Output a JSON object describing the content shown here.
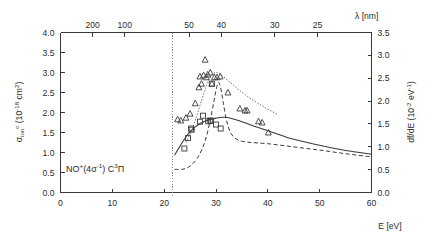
{
  "figure": {
    "background": "#ffffff",
    "ink": "#3a3a3a"
  },
  "annotation": {
    "species_prefix": "NO",
    "species_charge": "+",
    "orbital_open": "(4",
    "orbital_sigma": "σ",
    "orbital_exp": "-1",
    "orbital_close": ")",
    "state_letter": " C",
    "state_mult": "3",
    "state_term": "Π",
    "full_text": "NO+(4σ-1) C3Π"
  },
  "axes": {
    "bottom": {
      "label_main": "E",
      "label_unit": "[eV]",
      "label_full": "E [eV]",
      "min": 0,
      "max": 60,
      "ticks": [
        0,
        10,
        20,
        30,
        40,
        50,
        60
      ],
      "tick_labels": [
        "0",
        "10",
        "20",
        "30",
        "40",
        "50",
        "60"
      ]
    },
    "left": {
      "symbol": "σ",
      "subscript": "ion",
      "superscript": "c",
      "unit": "(10-18 cm2)",
      "label_full": "σion c (10-18 cm2)",
      "min": 0.0,
      "max": 4.0,
      "ticks": [
        0.0,
        0.5,
        1.0,
        1.5,
        2.0,
        2.5,
        3.0,
        3.5,
        4.0
      ],
      "tick_labels": [
        "0.0",
        "0.5",
        "1.0",
        "1.5",
        "2.0",
        "2.5",
        "3.0",
        "3.5",
        "4.0"
      ]
    },
    "right": {
      "label_main": "df/dE",
      "unit": "(10-2 eV-1)",
      "label_full": "df/dE (10-2 eV-1)",
      "min": 0.0,
      "max": 3.5,
      "ticks": [
        0.0,
        0.5,
        1.0,
        1.5,
        2.0,
        2.5,
        3.0,
        3.5
      ],
      "tick_labels": [
        "0.0",
        "0.5",
        "1.0",
        "1.5",
        "2.0",
        "2.5",
        "3.0",
        "3.5"
      ]
    },
    "top": {
      "symbol": "λ",
      "unit": "[nm]",
      "label_full": "λ [nm]",
      "tick_values_nm": [
        200,
        100,
        50,
        40,
        30,
        25
      ],
      "tick_labels": [
        "200",
        "100",
        "50",
        "40",
        "30",
        "25"
      ],
      "relation": "lambda_nm = 1239.84 / E_eV"
    }
  },
  "chart_data": {
    "type": "scatter",
    "title": "",
    "xlabel": "E [eV]",
    "ylabel": "σion c (10-18 cm2)",
    "y2label": "df/dE (10-2 eV-1)",
    "xlim": [
      0,
      60
    ],
    "ylim": [
      0.0,
      4.0
    ],
    "y2lim": [
      0.0,
      3.5
    ],
    "grid": false,
    "legend": "none",
    "annotations": [
      {
        "text": "NO+(4σ-1) C3Π",
        "x": 8.5,
        "y": 0.62
      },
      {
        "type": "vline",
        "label": "ionization threshold",
        "x": 21.7,
        "style": "dotted"
      }
    ],
    "series": [
      {
        "name": "squares",
        "marker": "open-square",
        "axis": "left",
        "points": [
          {
            "x": 23.9,
            "y": 1.1
          },
          {
            "x": 24.6,
            "y": 1.36
          },
          {
            "x": 25.2,
            "y": 1.6
          },
          {
            "x": 25.3,
            "y": 1.57
          },
          {
            "x": 26.9,
            "y": 1.77
          },
          {
            "x": 27.5,
            "y": 1.92
          },
          {
            "x": 28.5,
            "y": 1.78
          },
          {
            "x": 28.9,
            "y": 1.8
          },
          {
            "x": 29.0,
            "y": 1.79
          },
          {
            "x": 29.2,
            "y": 2.72
          },
          {
            "x": 30.0,
            "y": 1.7
          },
          {
            "x": 30.9,
            "y": 1.6
          }
        ]
      },
      {
        "name": "triangles",
        "marker": "open-triangle",
        "axis": "left",
        "points": [
          {
            "x": 22.6,
            "y": 1.83
          },
          {
            "x": 23.2,
            "y": 1.8
          },
          {
            "x": 24.2,
            "y": 1.87
          },
          {
            "x": 25.0,
            "y": 1.97
          },
          {
            "x": 26.0,
            "y": 2.23
          },
          {
            "x": 26.7,
            "y": 2.63
          },
          {
            "x": 26.9,
            "y": 2.9
          },
          {
            "x": 27.2,
            "y": 2.72
          },
          {
            "x": 27.6,
            "y": 2.93
          },
          {
            "x": 27.9,
            "y": 3.32
          },
          {
            "x": 28.1,
            "y": 2.88
          },
          {
            "x": 28.4,
            "y": 2.95
          },
          {
            "x": 28.9,
            "y": 3.0
          },
          {
            "x": 29.2,
            "y": 2.72
          },
          {
            "x": 29.7,
            "y": 2.88
          },
          {
            "x": 30.2,
            "y": 2.88
          },
          {
            "x": 30.8,
            "y": 2.9
          },
          {
            "x": 32.3,
            "y": 2.5
          },
          {
            "x": 34.6,
            "y": 2.1
          },
          {
            "x": 35.6,
            "y": 2.05
          },
          {
            "x": 36.0,
            "y": 2.05
          },
          {
            "x": 38.2,
            "y": 1.78
          },
          {
            "x": 38.9,
            "y": 1.75
          },
          {
            "x": 40.1,
            "y": 1.5
          }
        ]
      },
      {
        "name": "solid-curve",
        "style": "solid",
        "axis": "left",
        "points": [
          {
            "x": 22.0,
            "y": 0.93
          },
          {
            "x": 23.0,
            "y": 1.15
          },
          {
            "x": 24.0,
            "y": 1.35
          },
          {
            "x": 25.0,
            "y": 1.52
          },
          {
            "x": 26.0,
            "y": 1.64
          },
          {
            "x": 27.0,
            "y": 1.73
          },
          {
            "x": 28.0,
            "y": 1.79
          },
          {
            "x": 29.0,
            "y": 1.83
          },
          {
            "x": 30.0,
            "y": 1.86
          },
          {
            "x": 31.5,
            "y": 1.88
          },
          {
            "x": 33.0,
            "y": 1.85
          },
          {
            "x": 35.0,
            "y": 1.77
          },
          {
            "x": 38.0,
            "y": 1.63
          },
          {
            "x": 41.0,
            "y": 1.5
          },
          {
            "x": 45.0,
            "y": 1.33
          },
          {
            "x": 50.0,
            "y": 1.18
          },
          {
            "x": 55.0,
            "y": 1.05
          },
          {
            "x": 60.0,
            "y": 0.96
          }
        ]
      },
      {
        "name": "dashed-curve",
        "style": "dashed",
        "axis": "left",
        "points": [
          {
            "x": 22.0,
            "y": 0.58
          },
          {
            "x": 23.5,
            "y": 0.58
          },
          {
            "x": 25.0,
            "y": 0.66
          },
          {
            "x": 26.5,
            "y": 0.88
          },
          {
            "x": 27.8,
            "y": 1.25
          },
          {
            "x": 28.8,
            "y": 1.75
          },
          {
            "x": 29.6,
            "y": 2.28
          },
          {
            "x": 30.1,
            "y": 2.62
          },
          {
            "x": 30.5,
            "y": 2.75
          },
          {
            "x": 30.9,
            "y": 2.62
          },
          {
            "x": 31.4,
            "y": 2.25
          },
          {
            "x": 32.0,
            "y": 1.82
          },
          {
            "x": 32.8,
            "y": 1.5
          },
          {
            "x": 34.0,
            "y": 1.33
          },
          {
            "x": 36.0,
            "y": 1.26
          },
          {
            "x": 40.0,
            "y": 1.22
          },
          {
            "x": 45.0,
            "y": 1.14
          },
          {
            "x": 50.0,
            "y": 1.06
          },
          {
            "x": 55.0,
            "y": 0.97
          },
          {
            "x": 60.0,
            "y": 0.89
          }
        ]
      },
      {
        "name": "dotted-curve",
        "style": "dotted",
        "axis": "left",
        "points": [
          {
            "x": 24.2,
            "y": 1.25
          },
          {
            "x": 25.2,
            "y": 1.52
          },
          {
            "x": 26.2,
            "y": 1.88
          },
          {
            "x": 27.2,
            "y": 2.3
          },
          {
            "x": 28.2,
            "y": 2.68
          },
          {
            "x": 29.0,
            "y": 2.9
          },
          {
            "x": 29.6,
            "y": 2.98
          },
          {
            "x": 30.3,
            "y": 3.0
          },
          {
            "x": 31.2,
            "y": 2.92
          },
          {
            "x": 32.5,
            "y": 2.78
          },
          {
            "x": 34.5,
            "y": 2.56
          },
          {
            "x": 37.0,
            "y": 2.32
          },
          {
            "x": 39.5,
            "y": 2.12
          },
          {
            "x": 41.8,
            "y": 1.96
          }
        ]
      }
    ]
  }
}
